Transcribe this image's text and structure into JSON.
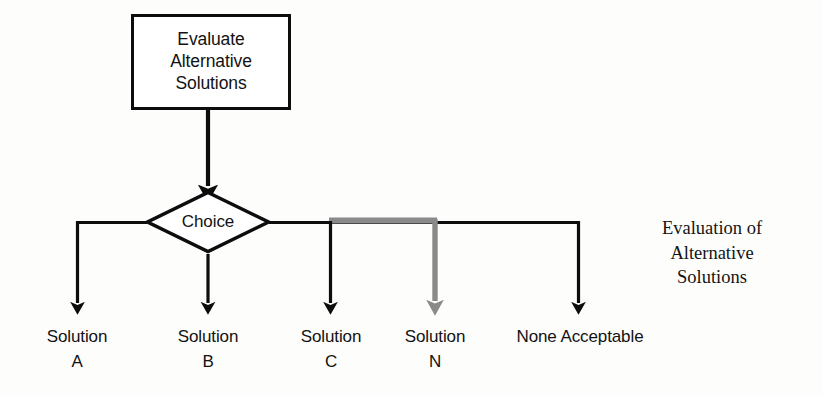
{
  "diagram": {
    "type": "flowchart",
    "process_box": {
      "lines": [
        "Evaluate",
        "Alternative",
        "Solutions"
      ]
    },
    "decision": {
      "label": "Choice",
      "shape": "diamond"
    },
    "caption": {
      "lines": [
        "Evaluation of",
        "Alternative",
        "Solutions"
      ]
    },
    "branches": [
      {
        "name": "solution-a",
        "line1": "Solution",
        "line2": "A",
        "highlight": false
      },
      {
        "name": "solution-b",
        "line1": "Solution",
        "line2": "B",
        "highlight": false
      },
      {
        "name": "solution-c",
        "line1": "Solution",
        "line2": "C",
        "highlight": false
      },
      {
        "name": "solution-n",
        "line1": "Solution",
        "line2": "N",
        "highlight": true
      },
      {
        "name": "none-acceptable",
        "line1": "None Acceptable",
        "line2": "",
        "highlight": false
      }
    ],
    "colors": {
      "stroke": "#0d0d0d",
      "highlight": "#8a8a8a",
      "background": "#fdfdfc",
      "text": "#121212"
    }
  }
}
